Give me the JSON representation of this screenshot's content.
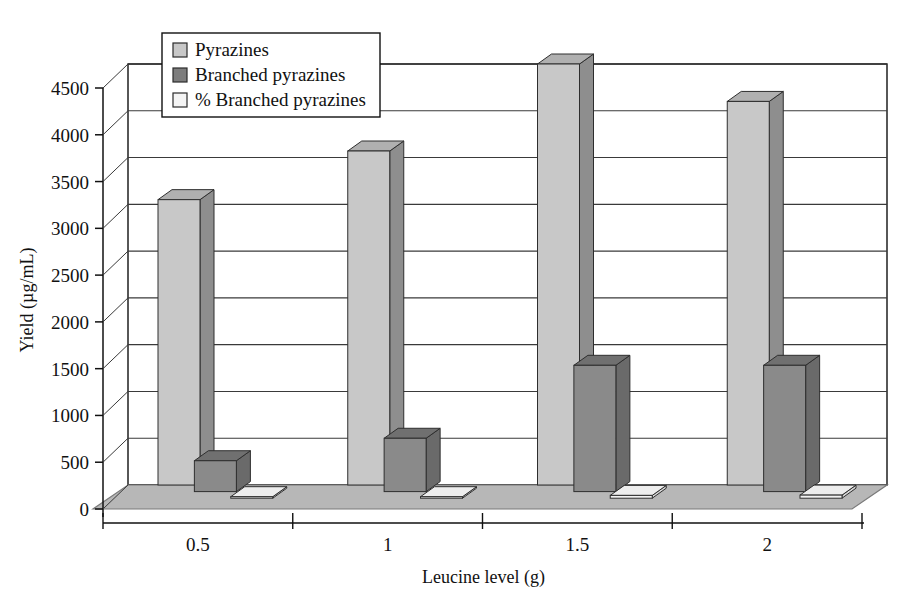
{
  "chart_data": {
    "type": "bar",
    "title": "",
    "xlabel": "Leucine level (g)",
    "ylabel": "Yield (µg/mL)",
    "categories": [
      "0.5",
      "1",
      "1.5",
      "2"
    ],
    "ylim": [
      0,
      4500
    ],
    "yticks": [
      "0",
      "500",
      "1000",
      "1500",
      "2000",
      "2500",
      "3000",
      "3500",
      "4000",
      "4500"
    ],
    "ytick_values": [
      0,
      500,
      1000,
      1500,
      2000,
      2500,
      3000,
      3500,
      4000,
      4500
    ],
    "grid": "horizontal",
    "legend_position": "top-left-inside",
    "projection": "3d-column",
    "series": [
      {
        "name": "Pyrazines",
        "color": "#c8c8c8",
        "side_color": "#8e8e8e",
        "top_color": "#b0b0b0",
        "values": [
          3050,
          3570,
          4500,
          4100
        ]
      },
      {
        "name": "Branched pyrazines",
        "color": "#8a8a8a",
        "side_color": "#6a6a6a",
        "top_color": "#707070",
        "values": [
          330,
          570,
          1350,
          1350
        ]
      },
      {
        "name": "% Branched pyrazines",
        "color": "#f2f2f2",
        "side_color": "#d6d6d6",
        "top_color": "#ededed",
        "values": [
          11,
          16,
          30,
          33
        ]
      }
    ]
  },
  "legend": {
    "items": [
      {
        "label": "Pyrazines",
        "swatch": "#c8c8c8"
      },
      {
        "label": "Branched pyrazines",
        "swatch": "#7d7d7d"
      },
      {
        "label": "% Branched pyrazines",
        "swatch": "#f4f4f4"
      }
    ]
  },
  "colors": {
    "floor": "#b7b7b7",
    "floor_edge": "#7a7a7a",
    "wall": "#ffffff",
    "gridline": "#3a3a3a",
    "axis": "#111111",
    "legend_bg": "#ffffff",
    "legend_border": "#111111"
  }
}
